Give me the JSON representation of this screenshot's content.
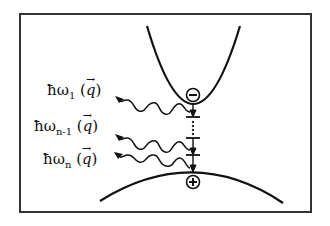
{
  "figure": {
    "conduction_band": {
      "carrier_symbol": "−",
      "carrier_name": "electron"
    },
    "valence_band": {
      "carrier_symbol": "+",
      "carrier_name": "hole"
    },
    "phonons": [
      {
        "prefix": "ħω",
        "subscript": "1",
        "open": " (",
        "q": "q",
        "arrow": "→",
        "close": ")"
      },
      {
        "prefix": "ħω",
        "subscript": "n-1",
        "open": " (",
        "q": "q",
        "arrow": "→",
        "close": ")"
      },
      {
        "prefix": "ħω",
        "subscript": "n",
        "open": " (",
        "q": "q",
        "arrow": "→",
        "close": ")"
      }
    ],
    "ellipsis": "⋮",
    "colors": {
      "line": "#111111",
      "frame": "#333333",
      "background": "#ffffff"
    }
  }
}
